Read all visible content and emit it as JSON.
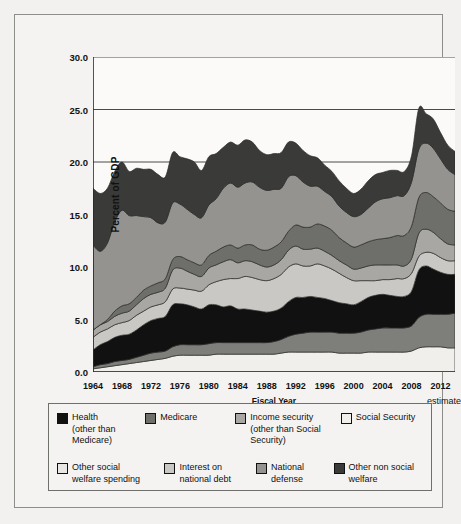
{
  "chart_data": {
    "type": "area",
    "title": "",
    "xlabel": "Fiscal Year",
    "ylabel": "Percent of GDP",
    "ylim": [
      0.0,
      30.0
    ],
    "yticks": [
      "0.0",
      "5.0",
      "10.0",
      "15.0",
      "20.0",
      "25.0",
      "30.0"
    ],
    "ytick_values": [
      0.0,
      5.0,
      10.0,
      15.0,
      20.0,
      25.0,
      30.0
    ],
    "grid": true,
    "grid_lines_at": [
      20.0,
      25.0,
      30.0
    ],
    "legend_position": "bottom",
    "xlim": [
      1964,
      2014
    ],
    "xticks": [
      "1964",
      "1968",
      "1972",
      "1976",
      "1980",
      "1984",
      "1988",
      "1992",
      "1996",
      "2000",
      "2004",
      "2008",
      "2012"
    ],
    "xtick_values": [
      1964,
      1968,
      1972,
      1976,
      1980,
      1984,
      1988,
      1992,
      1996,
      2000,
      2004,
      2008,
      2012
    ],
    "x_minor_tick_interval": 1,
    "annotation_estimate": "estimate",
    "x": [
      1964,
      1965,
      1966,
      1967,
      1968,
      1969,
      1970,
      1971,
      1972,
      1973,
      1974,
      1975,
      1976,
      1977,
      1978,
      1979,
      1980,
      1981,
      1982,
      1983,
      1984,
      1985,
      1986,
      1987,
      1988,
      1989,
      1990,
      1991,
      1992,
      1993,
      1994,
      1995,
      1996,
      1997,
      1998,
      1999,
      2000,
      2001,
      2002,
      2003,
      2004,
      2005,
      2006,
      2007,
      2008,
      2009,
      2010,
      2011,
      2012,
      2013,
      2014
    ],
    "stack_order_bottom_to_top": [
      "Social Security",
      "Health (other than Medicare)",
      "Other social welfare spending",
      "Interest on national debt",
      "Income security (other than Social Security)",
      "Medicare",
      "National defense",
      "Other non social welfare"
    ],
    "series": [
      {
        "name": "Social Security",
        "color": "#f0efec",
        "values": [
          0.3,
          0.4,
          0.5,
          0.6,
          0.7,
          0.8,
          0.9,
          1.0,
          1.1,
          1.2,
          1.3,
          1.5,
          1.6,
          1.6,
          1.6,
          1.6,
          1.6,
          1.7,
          1.7,
          1.7,
          1.7,
          1.7,
          1.7,
          1.7,
          1.7,
          1.7,
          1.8,
          1.9,
          1.9,
          1.9,
          1.9,
          1.9,
          1.9,
          1.9,
          1.8,
          1.8,
          1.8,
          1.8,
          1.9,
          1.9,
          1.9,
          1.9,
          1.9,
          1.9,
          2.0,
          2.3,
          2.4,
          2.4,
          2.4,
          2.3,
          2.3
        ]
      },
      {
        "name": "Health (other than Medicare)",
        "color": "#7e7e7b",
        "values": [
          0.2,
          0.3,
          0.3,
          0.4,
          0.4,
          0.4,
          0.5,
          0.6,
          0.7,
          0.7,
          0.7,
          0.9,
          1.0,
          1.0,
          1.0,
          1.0,
          1.1,
          1.1,
          1.1,
          1.1,
          1.1,
          1.1,
          1.1,
          1.1,
          1.1,
          1.2,
          1.3,
          1.5,
          1.7,
          1.8,
          1.9,
          1.9,
          1.9,
          1.9,
          1.9,
          1.9,
          1.9,
          2.0,
          2.1,
          2.2,
          2.3,
          2.3,
          2.3,
          2.3,
          2.4,
          2.9,
          3.1,
          3.1,
          3.1,
          3.2,
          3.3
        ]
      },
      {
        "name": "Other social welfare spending",
        "color": "#111111",
        "values": [
          1.6,
          1.9,
          2.1,
          2.3,
          2.4,
          2.4,
          2.6,
          2.9,
          3.1,
          3.2,
          3.3,
          4.0,
          3.9,
          3.8,
          3.6,
          3.4,
          3.7,
          3.6,
          3.4,
          3.5,
          3.2,
          3.2,
          3.1,
          3.0,
          2.9,
          2.9,
          3.0,
          3.3,
          3.5,
          3.4,
          3.4,
          3.3,
          3.2,
          3.0,
          2.9,
          2.8,
          2.7,
          2.9,
          3.1,
          3.2,
          3.2,
          3.1,
          3.0,
          3.0,
          3.3,
          4.5,
          4.6,
          4.3,
          4.0,
          3.8,
          3.7
        ]
      },
      {
        "name": "Interest on national debt",
        "color": "#c9c8c4",
        "values": [
          1.2,
          1.2,
          1.2,
          1.2,
          1.2,
          1.3,
          1.4,
          1.3,
          1.3,
          1.3,
          1.4,
          1.5,
          1.5,
          1.5,
          1.6,
          1.7,
          1.9,
          2.2,
          2.6,
          2.6,
          2.9,
          3.1,
          3.1,
          3.0,
          3.0,
          3.1,
          3.2,
          3.3,
          3.2,
          3.0,
          2.9,
          3.2,
          3.1,
          3.0,
          2.8,
          2.5,
          2.3,
          2.0,
          1.6,
          1.4,
          1.4,
          1.5,
          1.7,
          1.7,
          1.7,
          1.3,
          1.3,
          1.5,
          1.4,
          1.3,
          1.3
        ]
      },
      {
        "name": "Income security (other than Social Security)",
        "color": "#a8a7a3",
        "values": [
          0.7,
          0.7,
          0.7,
          0.8,
          0.9,
          0.9,
          1.0,
          1.2,
          1.2,
          1.2,
          1.3,
          1.8,
          1.9,
          1.7,
          1.5,
          1.4,
          1.6,
          1.6,
          1.7,
          1.8,
          1.5,
          1.5,
          1.5,
          1.4,
          1.3,
          1.3,
          1.4,
          1.6,
          1.7,
          1.6,
          1.6,
          1.5,
          1.4,
          1.3,
          1.2,
          1.2,
          1.1,
          1.2,
          1.4,
          1.5,
          1.4,
          1.4,
          1.3,
          1.2,
          1.4,
          2.2,
          2.2,
          2.0,
          1.8,
          1.6,
          1.5
        ]
      },
      {
        "name": "Medicare",
        "color": "#6e6e6b",
        "values": [
          0.0,
          0.0,
          0.2,
          0.5,
          0.7,
          0.7,
          0.7,
          0.8,
          0.8,
          0.9,
          0.9,
          1.0,
          1.1,
          1.1,
          1.1,
          1.1,
          1.2,
          1.3,
          1.4,
          1.4,
          1.4,
          1.5,
          1.6,
          1.5,
          1.6,
          1.7,
          1.7,
          1.8,
          2.0,
          2.1,
          2.1,
          2.3,
          2.4,
          2.4,
          2.2,
          2.1,
          2.1,
          2.2,
          2.3,
          2.4,
          2.5,
          2.6,
          2.8,
          2.9,
          3.1,
          3.4,
          3.5,
          3.4,
          3.4,
          3.3,
          3.2
        ]
      },
      {
        "name": "National defense",
        "color": "#949390",
        "values": [
          8.1,
          7.0,
          7.3,
          8.5,
          9.1,
          8.4,
          7.8,
          7.0,
          6.5,
          5.7,
          5.4,
          5.4,
          5.0,
          4.8,
          4.6,
          4.5,
          4.8,
          5.0,
          5.6,
          5.9,
          5.8,
          5.9,
          6.0,
          5.9,
          5.7,
          5.5,
          5.1,
          5.2,
          4.7,
          4.3,
          3.9,
          3.6,
          3.3,
          3.2,
          3.0,
          2.9,
          2.9,
          2.9,
          3.2,
          3.6,
          3.8,
          3.8,
          3.8,
          3.8,
          4.2,
          4.6,
          4.7,
          4.6,
          4.2,
          3.8,
          3.5
        ]
      },
      {
        "name": "Other non social welfare",
        "color": "#3a3a38",
        "values": [
          5.4,
          5.5,
          5.2,
          4.8,
          4.6,
          4.2,
          4.5,
          4.5,
          4.6,
          4.6,
          4.3,
          4.8,
          4.5,
          4.8,
          5.0,
          4.5,
          4.6,
          4.3,
          3.9,
          3.9,
          4.0,
          4.1,
          3.8,
          3.5,
          3.4,
          3.4,
          3.4,
          3.3,
          3.1,
          3.0,
          2.9,
          2.7,
          2.5,
          2.4,
          2.4,
          2.3,
          2.2,
          2.4,
          2.6,
          2.6,
          2.5,
          2.6,
          2.4,
          2.3,
          2.5,
          3.9,
          2.8,
          2.8,
          2.5,
          2.3,
          2.2
        ]
      }
    ]
  },
  "axes": {
    "ylabel": "Percent of GDP",
    "xlabel": "Fiscal Year",
    "estimate_note": "estimate",
    "ytick_labels": [
      "30.0",
      "25.0",
      "20.0",
      "15.0",
      "10.0",
      "5.0",
      "0.0"
    ],
    "xtick_labels": [
      "1964",
      "1968",
      "1972",
      "1976",
      "1980",
      "1984",
      "1988",
      "1992",
      "1996",
      "2000",
      "2004",
      "2008",
      "2012"
    ]
  },
  "legend": {
    "row1": [
      {
        "label": "Health\n(other than\nMedicare)",
        "color": "#111111",
        "swatch_name": "legend-swatch-health"
      },
      {
        "label": "Medicare",
        "color": "#6e6e6b",
        "swatch_name": "legend-swatch-medicare"
      },
      {
        "label": "Income security\n(other than Social\nSecurity)",
        "color": "#a8a7a3",
        "swatch_name": "legend-swatch-income-security"
      },
      {
        "label": "Social Security",
        "color": "#f0efec",
        "swatch_name": "legend-swatch-social-security"
      }
    ],
    "row2": [
      {
        "label": "Other social\nwelfare spending",
        "color": "#e8e7e4",
        "swatch_name": "legend-swatch-other-social-welfare"
      },
      {
        "label": "Interest on\nnational debt",
        "color": "#c9c8c4",
        "swatch_name": "legend-swatch-interest-debt"
      },
      {
        "label": "National\ndefense",
        "color": "#949390",
        "swatch_name": "legend-swatch-national-defense"
      },
      {
        "label": "Other non social\nwelfare",
        "color": "#3a3a38",
        "swatch_name": "legend-swatch-other-non-social-welfare"
      }
    ]
  }
}
